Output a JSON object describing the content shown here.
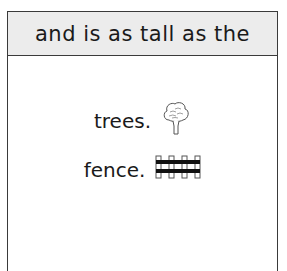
{
  "header": {
    "text": "and is as tall as the"
  },
  "options": [
    {
      "text": "trees.",
      "icon": "tree-icon"
    },
    {
      "text": "fence.",
      "icon": "fence-icon"
    }
  ]
}
